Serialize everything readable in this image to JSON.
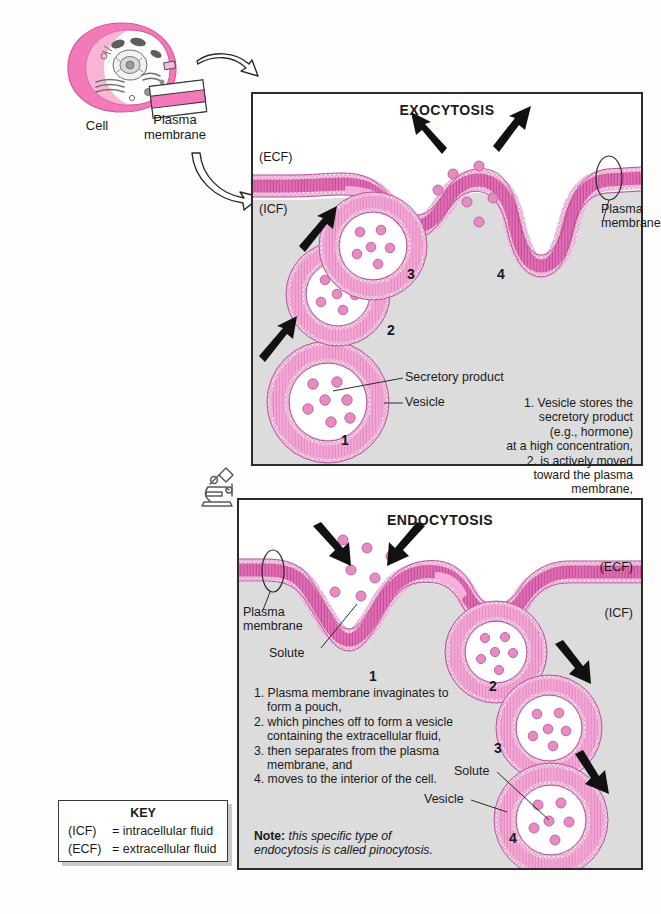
{
  "overview": {
    "cell_label": "Cell",
    "plasma_membrane_label": "Plasma\nmembrane",
    "plasma_membrane_line1": "Plasma",
    "plasma_membrane_line2": "membrane",
    "cell_icon": "animal-cell-cutaway",
    "membrane_swatch_icon": "plasma-membrane-swatch",
    "arrow_icon": "curved-outline-arrow",
    "microscope_icon": "microscope-icon"
  },
  "exocytosis": {
    "title": "EXOCYTOSIS",
    "ecf_label": "(ECF)",
    "icf_label": "(ICF)",
    "membrane_callout_line1": "Plasma",
    "membrane_callout_line2": "membrane",
    "secretory_product_label": "Secretory product",
    "vesicle_label": "Vesicle",
    "steps": [
      "1",
      "2",
      "3",
      "4"
    ],
    "caption_lines": [
      "1. Vesicle stores the",
      "secretory product",
      "(e.g., hormone)",
      "at a high concentration,",
      "2. is actively moved",
      "toward the plasma",
      "membrane,",
      "3. merges with it, and",
      "4. releases the secretory",
      "product to the extracellular fluid."
    ]
  },
  "endocytosis": {
    "title": "ENDOCYTOSIS",
    "ecf_label": "(ECF)",
    "icf_label": "(ICF)",
    "membrane_callout_line1": "Plasma",
    "membrane_callout_line2": "membrane",
    "solute_label_left": "Solute",
    "solute_label_right": "Solute",
    "vesicle_label": "Vesicle",
    "steps": [
      "1",
      "2",
      "3",
      "4"
    ],
    "caption_items": [
      "1. Plasma membrane invaginates to form a pouch,",
      "2. which pinches off to form a vesicle containing the extracellular fluid,",
      "3. then separates from the plasma membrane, and",
      "4. moves to the interior of the cell."
    ],
    "note_prefix": "Note:",
    "note_text": "this specific type of endocytosis is called pinocytosis."
  },
  "key": {
    "title": "KEY",
    "rows": [
      {
        "abbr": "(ICF)",
        "definition": "= intracellular fluid"
      },
      {
        "abbr": "(ECF)",
        "definition": "= extracellular fluid"
      }
    ]
  },
  "colors": {
    "membrane_pink": "#d24aa0",
    "membrane_light_pink": "#f0a8d2",
    "solute_pink": "#e58cc2",
    "icf_gray": "#dcdcdc",
    "outline": "#2b2b2b",
    "key_shadow": "#c9c9c9"
  }
}
